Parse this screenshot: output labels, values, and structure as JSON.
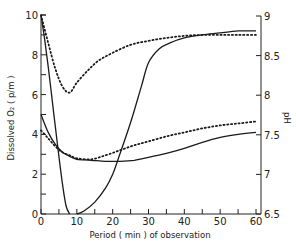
{
  "chart_data": {
    "type": "line",
    "title": "",
    "xlabel": "Period ( min ) of observation",
    "ylabel": "Dissolved O₂ ( p/m )",
    "y2label": "pH",
    "xlim": [
      0,
      60
    ],
    "ylim": [
      0,
      10
    ],
    "y2lim": [
      6.5,
      9
    ],
    "x_ticks": [
      "0",
      "10",
      "20",
      "30",
      "40",
      "50",
      "60"
    ],
    "y_ticks": [
      "0",
      "2",
      "4",
      "6",
      "8",
      "10"
    ],
    "y2_ticks": [
      "6.5",
      "7",
      "7.5",
      "8",
      "8.5",
      "9"
    ],
    "grid": false,
    "legend": null,
    "series": [
      {
        "name": "Dissolved O2 (steep decline)",
        "style": "solid",
        "axis": "left",
        "x": [
          0,
          1,
          2,
          3,
          4,
          5,
          6,
          7,
          8
        ],
        "y": [
          10,
          8.8,
          7.4,
          5.9,
          4.4,
          2.9,
          1.5,
          0.4,
          0
        ]
      },
      {
        "name": "Rising curve (O2 recovery / pH)",
        "style": "solid",
        "axis": "left",
        "x": [
          10,
          12,
          15,
          18,
          20,
          22,
          25,
          28,
          30,
          33,
          36,
          40,
          45,
          50,
          55,
          60
        ],
        "y": [
          0,
          0.15,
          0.6,
          1.3,
          2.0,
          3.0,
          4.6,
          6.4,
          7.6,
          8.3,
          8.6,
          8.85,
          9.0,
          9.1,
          9.2,
          9.2
        ]
      },
      {
        "name": "Upper dotted curve",
        "style": "dotted",
        "axis": "left",
        "x": [
          0,
          2,
          4,
          6,
          8,
          10,
          13,
          16,
          20,
          25,
          30,
          35,
          40,
          45,
          50,
          55,
          60
        ],
        "y": [
          10,
          8.6,
          7.3,
          6.4,
          6.1,
          6.6,
          7.2,
          7.7,
          8.1,
          8.5,
          8.7,
          8.85,
          8.95,
          9.0,
          9.0,
          9.0,
          9.0
        ]
      },
      {
        "name": "Lower solid curve (pH)",
        "style": "solid",
        "axis": "left",
        "x": [
          0,
          2,
          4,
          6,
          8,
          10,
          14,
          18,
          22,
          26,
          30,
          35,
          40,
          45,
          50,
          55,
          60
        ],
        "y": [
          5.0,
          4.1,
          3.5,
          3.1,
          2.9,
          2.75,
          2.7,
          2.65,
          2.65,
          2.7,
          2.85,
          3.05,
          3.3,
          3.6,
          3.85,
          4.0,
          4.1
        ]
      },
      {
        "name": "Lower dotted curve (pH)",
        "style": "dotted",
        "axis": "left",
        "x": [
          0,
          2,
          4,
          6,
          8,
          10,
          14,
          18,
          22,
          26,
          30,
          35,
          40,
          45,
          50,
          55,
          60
        ],
        "y": [
          4.2,
          3.8,
          3.4,
          3.1,
          2.95,
          2.8,
          2.75,
          2.95,
          3.2,
          3.45,
          3.65,
          3.9,
          4.1,
          4.3,
          4.45,
          4.55,
          4.65
        ]
      }
    ]
  },
  "labels": {
    "xlabel": "Period ( min ) of observation",
    "ylabel": "Dissolved O₂ ( p/m )",
    "y2label": "pH"
  }
}
